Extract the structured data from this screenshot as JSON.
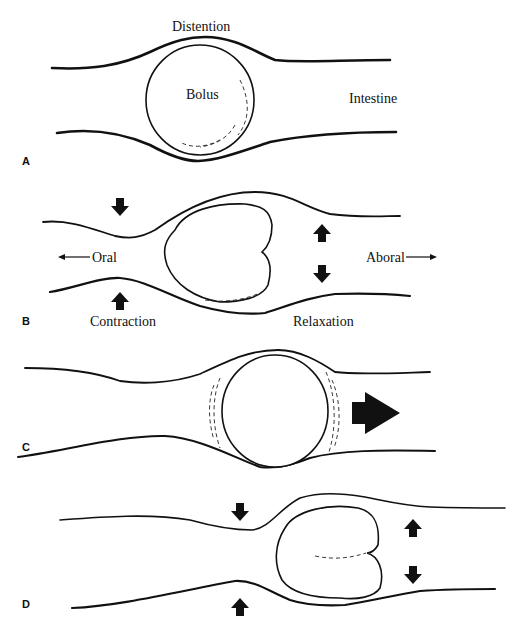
{
  "figure": {
    "panels": [
      {
        "id": "A",
        "label": "A",
        "annotations": {
          "distention": "Distention",
          "bolus": "Bolus",
          "intestine": "Intestine"
        }
      },
      {
        "id": "B",
        "label": "B",
        "annotations": {
          "oral": "Oral",
          "aboral": "Aboral",
          "contraction": "Contraction",
          "relaxation": "Relaxation"
        }
      },
      {
        "id": "C",
        "label": "C",
        "annotations": {}
      },
      {
        "id": "D",
        "label": "D",
        "annotations": {}
      }
    ]
  },
  "icons": {
    "contraction_arrow": "down-up-solid-arrow-pair",
    "relaxation_arrow": "up-down-solid-arrow-pair",
    "direction_arrow": "thin-arrow",
    "propulsion_arrow": "large-solid-right-arrow"
  },
  "colors": {
    "ink": "#111111",
    "background": "#ffffff"
  }
}
